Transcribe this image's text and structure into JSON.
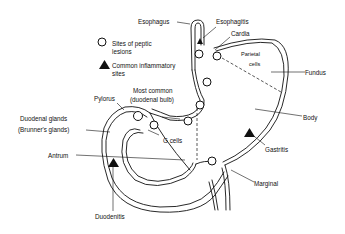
{
  "diagram": {
    "type": "anatomical illustration",
    "legend": {
      "circle_label_line1": "Sites of peptic",
      "circle_label_line2": "lesions",
      "triangle_label_line1": "Common inflammatory",
      "triangle_label_line2": "sites"
    },
    "labels": {
      "esophagus": "Esophagus",
      "esophagitis": "Esophagitis",
      "cardia": "Cardia",
      "parietal_line1": "Parietal",
      "parietal_line2": "cells",
      "fundus": "Fundus",
      "body": "Body",
      "gastritis": "Gastritis",
      "marginal": "Marginal",
      "pylorus": "Pylorus",
      "most_common_line1": "Most common",
      "most_common_line2": "(duodenal bulb)",
      "duodenal_glands_line1": "Duodenal glands",
      "duodenal_glands_line2": "(Brunner's glands)",
      "g_cells": "G cells",
      "antrum": "Antrum",
      "duodenitis": "Duodenitis"
    },
    "colors": {
      "ink": "#111111",
      "background": "#ffffff"
    }
  }
}
